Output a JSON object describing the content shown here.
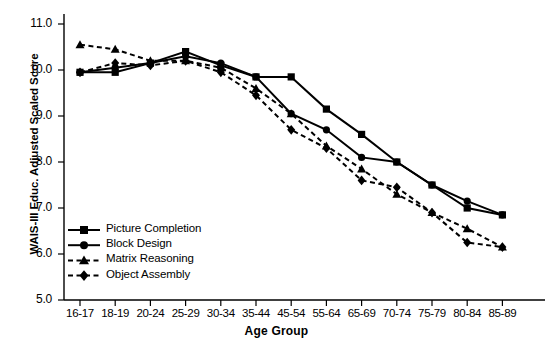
{
  "chart_data": {
    "type": "line",
    "title": "",
    "xlabel": "Age Group",
    "ylabel": "WAIS-III Educ. Adjusted Scaled Score",
    "categories": [
      "16-17",
      "18-19",
      "20-24",
      "25-29",
      "30-34",
      "35-44",
      "45-54",
      "55-64",
      "65-69",
      "70-74",
      "75-79",
      "80-84",
      "85-89"
    ],
    "ytick_labels": [
      "5.0",
      "6.0",
      "7.0",
      "8.0",
      "9.0",
      "10.0",
      "11.0"
    ],
    "yticks": [
      5.0,
      6.0,
      7.0,
      8.0,
      9.0,
      10.0,
      11.0
    ],
    "ylim": [
      5.0,
      11.0
    ],
    "grid": false,
    "legend_position": "lower-left-inside",
    "series": [
      {
        "name": "Picture Completion",
        "marker": "square",
        "linestyle": "solid",
        "color": "#000000",
        "values": [
          9.95,
          9.95,
          10.15,
          10.4,
          10.1,
          9.85,
          9.85,
          9.15,
          8.6,
          8.0,
          7.5,
          7.0,
          6.85
        ]
      },
      {
        "name": "Block Design",
        "marker": "circle",
        "linestyle": "solid",
        "color": "#000000",
        "values": [
          9.95,
          10.05,
          10.15,
          10.3,
          10.15,
          9.85,
          9.05,
          8.7,
          8.1,
          8.0,
          7.5,
          7.15,
          6.85
        ]
      },
      {
        "name": "Matrix Reasoning",
        "marker": "triangle",
        "linestyle": "dashed",
        "color": "#000000",
        "values": [
          10.55,
          10.45,
          10.2,
          10.2,
          10.05,
          9.6,
          9.05,
          8.35,
          7.85,
          7.3,
          6.9,
          6.55,
          6.15
        ]
      },
      {
        "name": "Object Assembly",
        "marker": "diamond",
        "linestyle": "dashed",
        "color": "#000000",
        "values": [
          9.95,
          10.15,
          10.1,
          10.2,
          9.95,
          9.45,
          8.7,
          8.3,
          7.6,
          7.45,
          6.9,
          6.25,
          6.15
        ]
      }
    ]
  },
  "legend": {
    "items": [
      {
        "label": "Picture Completion"
      },
      {
        "label": "Block Design"
      },
      {
        "label": "Matrix Reasoning"
      },
      {
        "label": "Object Assembly"
      }
    ]
  }
}
